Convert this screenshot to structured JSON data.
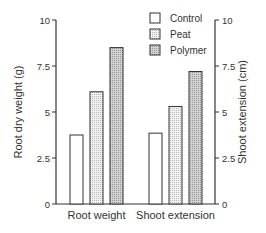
{
  "chart_data": {
    "type": "bar",
    "title": "",
    "categories": [
      "Root weight",
      "Shoot extension"
    ],
    "series": [
      {
        "name": "Control",
        "values": [
          3.75,
          3.85
        ],
        "pattern": "white"
      },
      {
        "name": "Peat",
        "values": [
          6.1,
          5.3
        ],
        "pattern": "light-stipple"
      },
      {
        "name": "Polymer",
        "values": [
          8.5,
          7.2
        ],
        "pattern": "dark-stipple"
      }
    ],
    "ylabel_left": "Root dry weight (g)",
    "ylabel_right": "Shoot extension (cm)",
    "ylim": [
      0,
      10
    ],
    "yticks": [
      "0",
      "2.5",
      "5",
      "7.5",
      "10"
    ],
    "ytick_values": [
      0,
      2.5,
      5,
      7.5,
      10
    ],
    "grid": false,
    "legend_position": "top-right-inside"
  },
  "legend": {
    "items": [
      "Control",
      "Peat",
      "Polymer"
    ]
  }
}
